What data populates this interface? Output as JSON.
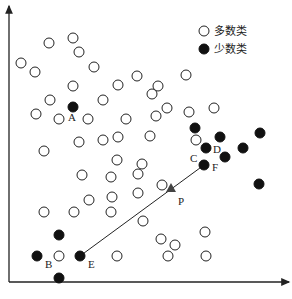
{
  "legend": {
    "majority": {
      "label": "多数类",
      "icon": "open-circle"
    },
    "minority": {
      "label": "少数类",
      "icon": "filled-circle"
    }
  },
  "colors": {
    "stroke": "#222222",
    "fill_minority": "#111111",
    "fill_majority": "#ffffff",
    "arrow": "#444444"
  },
  "axes": {
    "origin": [
      9,
      282
    ],
    "x_end": [
      289,
      282
    ],
    "y_end": [
      9,
      6
    ]
  },
  "majority_points": [
    [
      73,
      38
    ],
    [
      49,
      43
    ],
    [
      79,
      52
    ],
    [
      94,
      67
    ],
    [
      21,
      63
    ],
    [
      35,
      72
    ],
    [
      137,
      76
    ],
    [
      118,
      85
    ],
    [
      73,
      86
    ],
    [
      158,
      86
    ],
    [
      186,
      75
    ],
    [
      50,
      100
    ],
    [
      103,
      100
    ],
    [
      152,
      94
    ],
    [
      189,
      112
    ],
    [
      167,
      108
    ],
    [
      214,
      108
    ],
    [
      36,
      114
    ],
    [
      59,
      119
    ],
    [
      88,
      119
    ],
    [
      126,
      119
    ],
    [
      79,
      142
    ],
    [
      103,
      140
    ],
    [
      118,
      137
    ],
    [
      150,
      136
    ],
    [
      44,
      151
    ],
    [
      156,
      116
    ],
    [
      117,
      160
    ],
    [
      142,
      164
    ],
    [
      82,
      175
    ],
    [
      111,
      177
    ],
    [
      138,
      174
    ],
    [
      89,
      200
    ],
    [
      112,
      197
    ],
    [
      138,
      193
    ],
    [
      44,
      212
    ],
    [
      74,
      212
    ],
    [
      111,
      212
    ],
    [
      143,
      221
    ],
    [
      162,
      185
    ],
    [
      161,
      239
    ],
    [
      175,
      245
    ],
    [
      205,
      232
    ],
    [
      59,
      256
    ],
    [
      117,
      256
    ],
    [
      168,
      256
    ],
    [
      206,
      256
    ],
    [
      196,
      140
    ]
  ],
  "minority_points": [
    {
      "x": 73,
      "y": 107,
      "label": "A",
      "lx": 68,
      "ly": 121
    },
    {
      "x": 37,
      "y": 256,
      "label": "B",
      "lx": 45,
      "ly": 268
    },
    {
      "x": 80,
      "y": 256,
      "label": "E",
      "lx": 88,
      "ly": 268
    },
    {
      "x": 59,
      "y": 235,
      "label": ""
    },
    {
      "x": 59,
      "y": 278,
      "label": ""
    },
    {
      "x": 195,
      "y": 128,
      "label": ""
    },
    {
      "x": 220,
      "y": 137,
      "label": ""
    },
    {
      "x": 206,
      "y": 148,
      "label": "D",
      "lx": 213,
      "ly": 153
    },
    {
      "x": 225,
      "y": 157,
      "label": ""
    },
    {
      "x": 243,
      "y": 148,
      "label": ""
    },
    {
      "x": 260,
      "y": 133,
      "label": ""
    },
    {
      "x": 204,
      "y": 165,
      "label": "F",
      "lx": 212,
      "ly": 171
    },
    {
      "x": 259,
      "y": 184,
      "label": ""
    }
  ],
  "extra_labels": [
    {
      "text": "C",
      "x": 190,
      "y": 162
    }
  ],
  "synthetic_point": {
    "x": 171,
    "y": 188,
    "label": "P",
    "lx": 178,
    "ly": 205
  },
  "interpolation_line": {
    "x1": 80,
    "y1": 256,
    "x2": 204,
    "y2": 165
  }
}
